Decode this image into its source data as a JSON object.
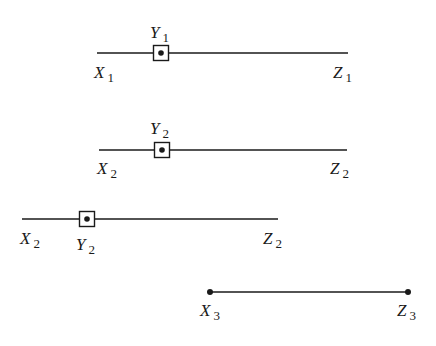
{
  "diagram": {
    "colors": {
      "stroke": "#1a1a1a",
      "background": "#ffffff"
    },
    "rows": [
      {
        "id": "row1",
        "line": {
          "x1": 97,
          "x2": 348,
          "y": 53
        },
        "endpoints": "plain",
        "marker": {
          "type": "boxed-dot",
          "x": 161,
          "y": 53
        },
        "labels": [
          {
            "name": "x-label",
            "letter": "X",
            "sub": "1",
            "x": 94,
            "y": 78
          },
          {
            "name": "y-label",
            "letter": "Y",
            "sub": "1",
            "x": 150,
            "y": 38
          },
          {
            "name": "z-label",
            "letter": "Z",
            "sub": "1",
            "x": 333,
            "y": 78
          }
        ]
      },
      {
        "id": "row2",
        "line": {
          "x1": 99,
          "x2": 347,
          "y": 150
        },
        "endpoints": "plain",
        "marker": {
          "type": "boxed-dot",
          "x": 162,
          "y": 150
        },
        "labels": [
          {
            "name": "x-label",
            "letter": "X",
            "sub": "2",
            "x": 97,
            "y": 174
          },
          {
            "name": "y-label",
            "letter": "Y",
            "sub": "2",
            "x": 150,
            "y": 134
          },
          {
            "name": "z-label",
            "letter": "Z",
            "sub": "2",
            "x": 330,
            "y": 174
          }
        ]
      },
      {
        "id": "row3",
        "line": {
          "x1": 22,
          "x2": 278,
          "y": 219
        },
        "endpoints": "plain",
        "marker": {
          "type": "boxed-dot",
          "x": 87,
          "y": 219
        },
        "labels": [
          {
            "name": "x-label",
            "letter": "X",
            "sub": "2",
            "x": 20,
            "y": 244
          },
          {
            "name": "y-label",
            "letter": "Y",
            "sub": "2",
            "x": 76,
            "y": 250
          },
          {
            "name": "z-label",
            "letter": "Z",
            "sub": "2",
            "x": 263,
            "y": 244
          }
        ]
      },
      {
        "id": "row4",
        "line": {
          "x1": 210,
          "x2": 408,
          "y": 292
        },
        "endpoints": "dots",
        "marker": null,
        "labels": [
          {
            "name": "x-label",
            "letter": "X",
            "sub": "3",
            "x": 200,
            "y": 316
          },
          {
            "name": "z-label",
            "letter": "Z",
            "sub": "3",
            "x": 397,
            "y": 316
          }
        ]
      }
    ]
  }
}
